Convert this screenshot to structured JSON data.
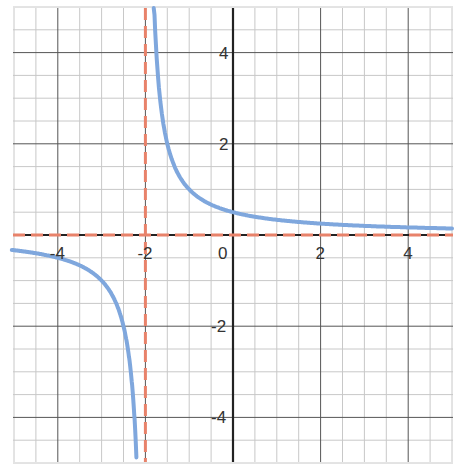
{
  "chart_data": {
    "type": "line",
    "title": "",
    "xlabel": "",
    "ylabel": "",
    "xlim": [
      -5,
      5
    ],
    "ylim": [
      -5,
      5
    ],
    "grid": true,
    "minor_grid_step": 0.5,
    "x_ticks": [
      -4,
      -2,
      0,
      2,
      4
    ],
    "y_ticks": [
      4,
      2,
      -2,
      -4
    ],
    "x_tick_labels": [
      "-4",
      "-2",
      "0",
      "2",
      "4"
    ],
    "y_tick_labels": [
      "4",
      "2",
      "-2",
      "-4"
    ],
    "series": [
      {
        "name": "y = 1/(x+2)",
        "style": "solid",
        "color": "#7fa7dd",
        "function": "1/(x+2)",
        "points_sample": [
          [
            -5,
            -0.333
          ],
          [
            -4,
            -0.5
          ],
          [
            -3,
            -1
          ],
          [
            -2.5,
            -2
          ],
          [
            -2.2,
            -5
          ],
          [
            -1.8,
            5
          ],
          [
            -1.5,
            2
          ],
          [
            -1,
            1
          ],
          [
            0,
            0.5
          ],
          [
            2,
            0.25
          ],
          [
            4,
            0.167
          ],
          [
            5,
            0.143
          ]
        ]
      },
      {
        "name": "vertical asymptote x = -2",
        "style": "dashed",
        "color": "#e8826a",
        "x": -2
      },
      {
        "name": "horizontal asymptote y = 0",
        "style": "dashed",
        "color": "#e8826a",
        "y": 0
      }
    ]
  },
  "labels": {
    "origin": "0"
  },
  "colors": {
    "curve": "#7fa7dd",
    "asymptote": "#e8826a",
    "axis": "#222222",
    "major_grid": "#555555",
    "minor_grid": "#c8c8c8"
  }
}
